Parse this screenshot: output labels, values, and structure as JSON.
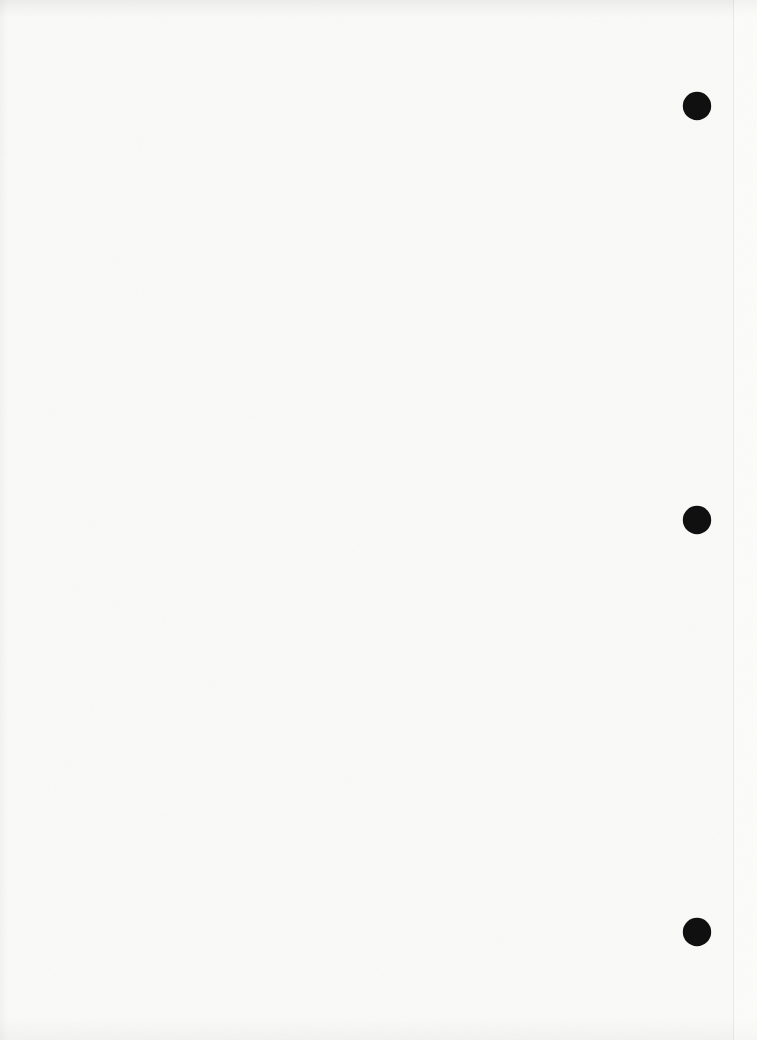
{
  "page": {
    "background_color": "#fafaf8",
    "text_content": "",
    "punch_holes": {
      "count": "3",
      "color": "#101010",
      "items": [
        {
          "label": "punch-hole-top"
        },
        {
          "label": "punch-hole-middle"
        },
        {
          "label": "punch-hole-bottom"
        }
      ]
    }
  }
}
